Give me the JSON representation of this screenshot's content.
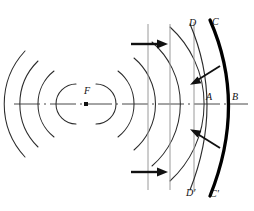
{
  "figure": {
    "background_color": "#ffffff",
    "width": 254,
    "height": 211,
    "colors": {
      "ink": "#1a1a1a",
      "arc_stroke": "#2b2b2b",
      "vertical_line": "#9a9a9a",
      "mirror": "#000000",
      "axis": "#333333"
    },
    "labels": {
      "focus": "F",
      "point_a": "A",
      "point_b": "B",
      "point_c": "C",
      "point_c_prime": "C'",
      "point_d": "D",
      "point_d_prime": "D'"
    },
    "axis": {
      "name": "optical-axis",
      "style": "dash-dot",
      "y": 104
    },
    "focus_point": {
      "x": 86,
      "y": 104,
      "marker": "square-dot"
    },
    "left_wavefronts": {
      "count": 4,
      "description": "diverging spherical wavefront arcs opening left",
      "radii": [
        20,
        42,
        60,
        78
      ]
    },
    "right_wavefronts": {
      "count": 4,
      "description": "diverging spherical wavefront arcs opening right",
      "radii": [
        20,
        42,
        60,
        78
      ]
    },
    "vertical_lines": {
      "count": 3,
      "x_positions": [
        148,
        170,
        194
      ],
      "description": "vertical reference lines / plane wavefront traces"
    },
    "arrows_horizontal": [
      {
        "name": "incident-ray-arrow-top",
        "x1": 130,
        "y": 44,
        "x2": 166,
        "direction": "right"
      },
      {
        "name": "incident-ray-arrow-bottom",
        "x1": 130,
        "y": 172,
        "x2": 166,
        "direction": "right"
      }
    ],
    "arrows_diagonal": [
      {
        "name": "reflected-ray-arrow-top",
        "direction": "down-left"
      },
      {
        "name": "reflected-ray-arrow-bottom",
        "direction": "up-left"
      }
    ],
    "mirror": {
      "name": "curved-mirror-CC'",
      "vertex_x": 233,
      "top_y": 20,
      "bottom_y": 196,
      "stroke_width": 3.2,
      "description": "thick concave mirror arc from C to C' with vertex at B"
    },
    "arc_dd": {
      "name": "wavefront-DD'",
      "vertex_x": 215,
      "description": "wavefront arc through A from D to D'"
    }
  }
}
